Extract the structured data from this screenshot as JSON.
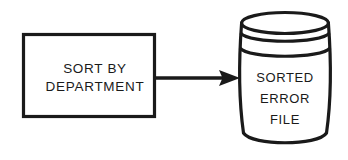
{
  "diagram": {
    "type": "flowchart",
    "background_color": "#ffffff",
    "line_color": "#1a1a1a",
    "fill_color": "#ffffff",
    "process": {
      "shape": "rectangle",
      "label_line_1": "SORT BY",
      "label_line_2": "DEPARTMENT"
    },
    "connector": {
      "shape": "arrow",
      "direction": "right",
      "label": ""
    },
    "datastore": {
      "shape": "cylinder",
      "label_line_1": "SORTED",
      "label_line_2": "ERROR",
      "label_line_3": "FILE"
    }
  }
}
